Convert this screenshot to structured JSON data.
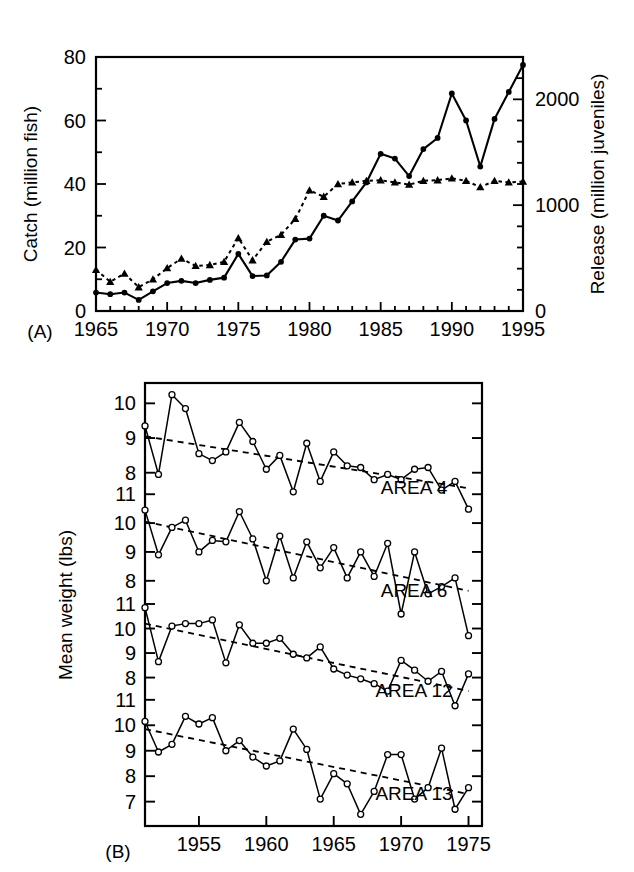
{
  "figure": {
    "panels": [
      "(A)",
      "(B)"
    ]
  },
  "panelA": {
    "tag": "(A)",
    "ylabel_left": "Catch (million fish)",
    "ylabel_right": "Release (million juveniles)",
    "y_ticks_left": [
      "0",
      "20",
      "40",
      "60",
      "80"
    ],
    "y_ticks_right": [
      "0",
      "1000",
      "2000"
    ],
    "x_ticks": [
      "1965",
      "1970",
      "1975",
      "1980",
      "1985",
      "1990",
      "1995"
    ]
  },
  "panelB": {
    "tag": "(B)",
    "ylabel": "Mean weight (lbs)",
    "x_ticks": [
      "1955",
      "1960",
      "1965",
      "1970",
      "1975"
    ],
    "series_labels": [
      "AREA 4",
      "AREA 6",
      "AREA 12",
      "AREA 13"
    ],
    "y_ticks_area4": [
      "8",
      "9",
      "10"
    ],
    "y_ticks_area6": [
      "8",
      "9",
      "10",
      "11"
    ],
    "y_ticks_area12": [
      "8",
      "9",
      "10",
      "11"
    ],
    "y_ticks_area13": [
      "7",
      "8",
      "9",
      "10",
      "11"
    ]
  },
  "chart_data": [
    {
      "type": "line",
      "panel": "(A)",
      "title": "",
      "xlabel": "",
      "ylabel": "Catch (million fish)",
      "ylabel_right": "Release (million juveniles)",
      "xlim": [
        1965,
        1995
      ],
      "ylim": [
        0,
        80
      ],
      "ylim_right": [
        0,
        2400
      ],
      "grid": false,
      "legend": "none",
      "x": [
        1965,
        1966,
        1967,
        1968,
        1969,
        1970,
        1971,
        1972,
        1973,
        1974,
        1975,
        1976,
        1977,
        1978,
        1979,
        1980,
        1981,
        1982,
        1983,
        1984,
        1985,
        1986,
        1987,
        1988,
        1989,
        1990,
        1991,
        1992,
        1993,
        1994,
        1995
      ],
      "series": [
        {
          "name": "Catch",
          "marker": "filled-circle",
          "linestyle": "solid",
          "axis": "left",
          "units": "million fish",
          "values": [
            5.8,
            5.3,
            5.8,
            3.5,
            6.2,
            8.8,
            9.5,
            8.8,
            9.8,
            10.5,
            18.0,
            11.0,
            11.2,
            15.5,
            22.5,
            22.8,
            30.0,
            28.5,
            34.5,
            40.5,
            49.5,
            48.0,
            42.5,
            51.0,
            54.5,
            68.5,
            60.0,
            45.5,
            60.5,
            69.0,
            77.5
          ]
        },
        {
          "name": "Release",
          "marker": "filled-triangle",
          "linestyle": "dotted",
          "axis": "right",
          "units": "million juveniles",
          "values_left_scale": [
            13.0,
            9.2,
            11.8,
            7.5,
            10.0,
            13.5,
            16.5,
            14.2,
            14.5,
            15.5,
            23.0,
            16.0,
            21.8,
            24.0,
            29.0,
            38.0,
            36.0,
            40.0,
            40.5,
            41.0,
            41.2,
            40.5,
            39.8,
            41.0,
            41.2,
            41.8,
            41.0,
            39.0,
            41.0,
            40.5,
            40.8
          ],
          "values": [
            390,
            276,
            354,
            225,
            300,
            405,
            495,
            426,
            435,
            465,
            690,
            480,
            654,
            720,
            870,
            1140,
            1080,
            1200,
            1215,
            1230,
            1236,
            1215,
            1194,
            1230,
            1236,
            1254,
            1230,
            1170,
            1230,
            1215,
            1224
          ]
        }
      ]
    },
    {
      "type": "line",
      "panel": "(B)",
      "title": "",
      "xlabel": "",
      "ylabel": "Mean weight (lbs)",
      "xlim": [
        1951,
        1976
      ],
      "grid": false,
      "legend": "inline-right",
      "x": [
        1951,
        1952,
        1953,
        1954,
        1955,
        1956,
        1957,
        1958,
        1959,
        1960,
        1961,
        1962,
        1963,
        1964,
        1965,
        1966,
        1967,
        1968,
        1969,
        1970,
        1971,
        1972,
        1973,
        1974,
        1975
      ],
      "series": [
        {
          "name": "AREA 4",
          "marker": "open-circle",
          "linestyle": "solid",
          "ylim": [
            7.3,
            10.5
          ],
          "yticks": [
            8,
            9,
            10
          ],
          "values": [
            9.35,
            7.95,
            10.25,
            9.85,
            8.55,
            8.35,
            8.6,
            9.45,
            8.9,
            8.1,
            8.5,
            7.45,
            8.85,
            7.75,
            8.6,
            8.2,
            8.15,
            7.8,
            7.95,
            7.8,
            8.1,
            8.15,
            7.5,
            7.75,
            6.95
          ],
          "trend": {
            "start": 9.05,
            "end": 7.55,
            "style": "dashed"
          }
        },
        {
          "name": "AREA 6",
          "marker": "open-circle",
          "linestyle": "solid",
          "ylim": [
            7.3,
            10.8
          ],
          "yticks": [
            8,
            9,
            10,
            11
          ],
          "values": [
            10.45,
            8.9,
            9.85,
            10.1,
            9.0,
            9.4,
            9.35,
            10.4,
            9.45,
            8.0,
            9.55,
            8.1,
            9.35,
            8.45,
            9.15,
            8.1,
            9.0,
            8.15,
            9.3,
            6.85,
            9.0,
            7.55,
            7.8,
            8.1,
            6.1
          ],
          "trend": {
            "start": 10.05,
            "end": 7.65,
            "style": "dashed"
          }
        },
        {
          "name": "AREA 12",
          "marker": "open-circle",
          "linestyle": "solid",
          "ylim": [
            6.8,
            11.0
          ],
          "yticks": [
            8,
            9,
            10,
            11
          ],
          "values": [
            10.85,
            8.65,
            10.1,
            10.2,
            10.2,
            10.35,
            8.6,
            10.15,
            9.4,
            9.4,
            9.6,
            8.95,
            8.8,
            9.25,
            8.35,
            8.1,
            7.95,
            7.75,
            7.45,
            8.7,
            8.3,
            7.85,
            8.25,
            6.85,
            8.15
          ],
          "trend": {
            "start": 10.2,
            "end": 7.45,
            "style": "dashed"
          }
        },
        {
          "name": "AREA 13",
          "marker": "open-circle",
          "linestyle": "solid",
          "ylim": [
            6.2,
            10.6
          ],
          "yticks": [
            7,
            8,
            9,
            10,
            11
          ],
          "values": [
            10.15,
            8.95,
            9.25,
            10.35,
            10.05,
            10.3,
            9.0,
            9.4,
            8.75,
            8.4,
            8.6,
            9.85,
            9.05,
            7.1,
            8.1,
            7.7,
            6.5,
            7.4,
            8.85,
            8.85,
            7.1,
            7.55,
            9.1,
            6.7,
            7.55
          ],
          "trend": {
            "start": 9.85,
            "end": 7.3,
            "style": "dashed"
          }
        }
      ]
    }
  ]
}
